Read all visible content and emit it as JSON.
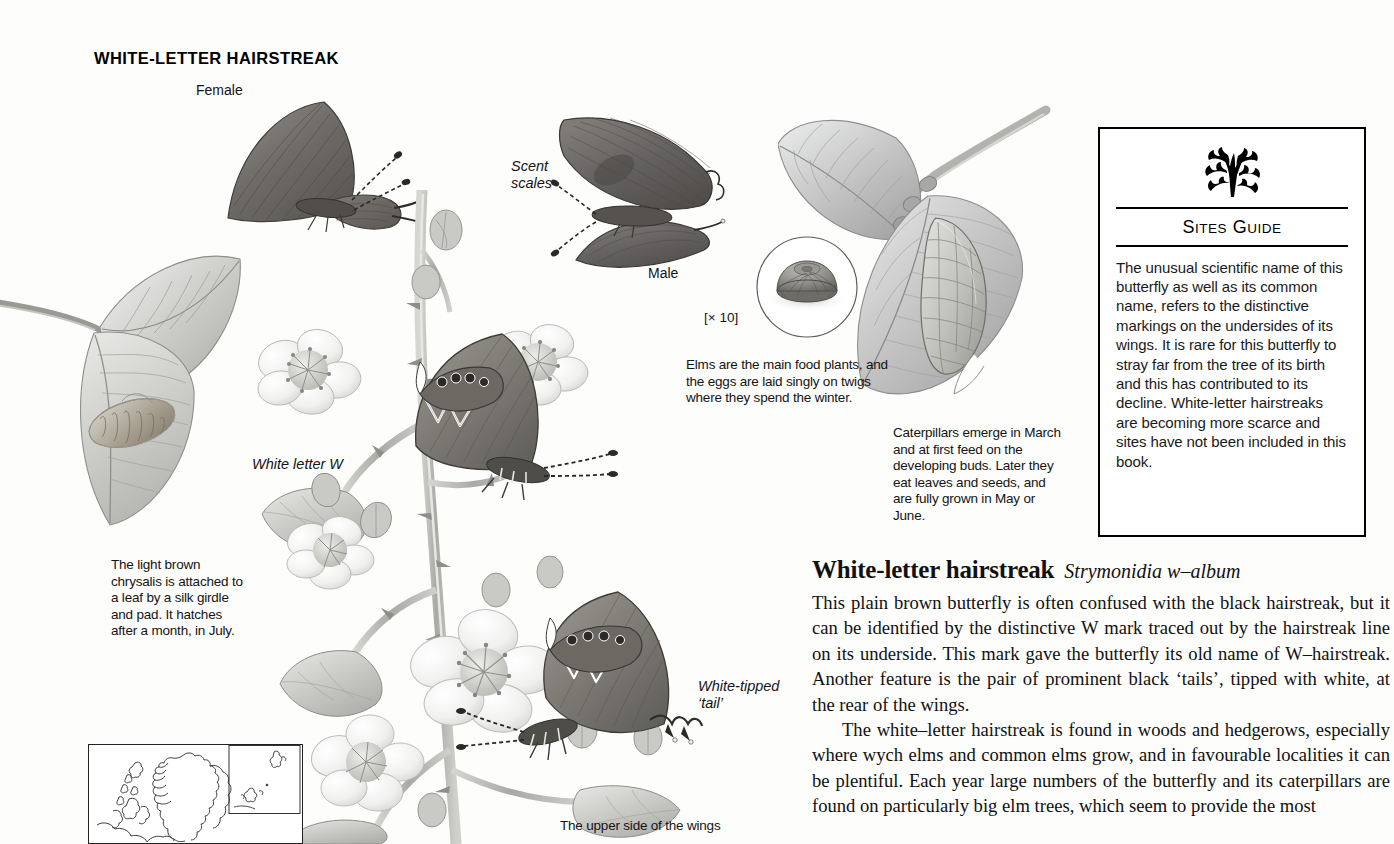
{
  "page": {
    "heading": "WHITE-LETTER HAIRSTREAK",
    "background_color": "#fdfdfc",
    "text_color": "#111111"
  },
  "figure_labels": {
    "female": "Female",
    "male": "Male",
    "scent_scales": "Scent\nscales",
    "magnification": "[× 10]",
    "white_letter_w": "White letter W",
    "white_tipped_tail": "White-tipped\n‘tail’",
    "upper_side": "The upper side of the wings"
  },
  "captions": {
    "chrysalis": "The light brown chrysalis is attached to a leaf by a silk girdle and pad. It hatches after a month, in July.",
    "eggs": "Elms are the main food plants, and the eggs are laid singly on twigs where they spend the winter.",
    "caterpillars": "Caterpillars emerge in March and at first feed on the developing buds. Later they eat leaves and seeds, and are fully grown in May or June."
  },
  "sites_guide": {
    "icon": "oak-leaf-sprig",
    "title_first_letters": "S",
    "title_word_one_rest": "ITES",
    "title_second_letter": "G",
    "title_word_two_rest": "UIDE",
    "title": "SITES GUIDE",
    "body": "The unusual scientific name of this butterfly as well as its common name, refers to the distinctive markings on the undersides of its wings. It is rare for this butterfly to stray far from the tree of its birth and this has contributed to its decline. White-letter hairstreaks are becoming more scarce and sites have not been included in this book."
  },
  "article": {
    "common_name": "White-letter hairstreak",
    "scientific_name": "Strymonidia w–album",
    "paragraph_1": "This plain brown butterfly is often confused with the black hairstreak, but it can be identified by the distinctive W mark traced out by the hairstreak line on its underside. This mark gave the butterfly its old name of W–hairstreak. Another feature is the pair of prominent black ‘tails’, tipped with white, at the rear of the wings.",
    "paragraph_2": "The white–letter hairstreak is found in woods and hedgerows, especially where wych elms and common elms grow, and in favourable localities it can be plentiful. Each year large numbers of the butterfly and its caterpillars are found on particularly big elm trees, which seem to provide the most"
  },
  "map": {
    "name": "distribution-map",
    "description": "Outline map of Britain with inset box for northern isles"
  },
  "illustrations": [
    {
      "name": "female-butterfly-illustration"
    },
    {
      "name": "male-butterfly-illustration"
    },
    {
      "name": "egg-magnified-illustration"
    },
    {
      "name": "elm-leaf-caterpillar-illustration"
    },
    {
      "name": "chrysalis-on-leaf-illustration"
    },
    {
      "name": "bramble-with-butterflies-illustration"
    }
  ]
}
